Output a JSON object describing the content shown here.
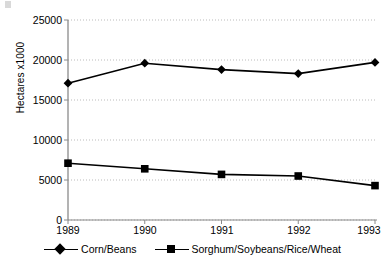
{
  "chart_data": {
    "type": "line",
    "title": "",
    "xlabel": "",
    "ylabel": "Hectares x1000",
    "categories": [
      "1989",
      "1990",
      "1991",
      "1992",
      "1993"
    ],
    "ylim": [
      0,
      25000
    ],
    "yticks": [
      0,
      5000,
      10000,
      15000,
      20000,
      25000
    ],
    "ytick_labels": [
      "0",
      "5000",
      "10000",
      "15000",
      "20000",
      "25000"
    ],
    "grid": true,
    "legend_position": "bottom",
    "series": [
      {
        "name": "Corn/Beans",
        "marker": "diamond",
        "color": "#000000",
        "values": [
          17100,
          19600,
          18800,
          18300,
          19700
        ]
      },
      {
        "name": "Sorghum/Soybeans/Rice/Wheat",
        "marker": "square",
        "color": "#000000",
        "values": [
          7100,
          6400,
          5700,
          5500,
          4300
        ]
      }
    ]
  },
  "axis": {
    "y_label": "Hectares x1000",
    "y_tick_labels": [
      "25000",
      "20000",
      "15000",
      "10000",
      "5000",
      "0"
    ],
    "x_tick_labels": [
      "1989",
      "1990",
      "1991",
      "1992",
      "1993"
    ]
  },
  "legend": {
    "items": [
      {
        "label": "Corn/Beans",
        "marker": "diamond-marker"
      },
      {
        "label": "Sorghum/Soybeans/Rice/Wheat",
        "marker": "square-marker"
      }
    ]
  }
}
